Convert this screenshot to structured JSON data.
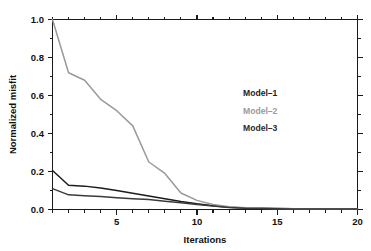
{
  "chart_data": {
    "type": "line",
    "title": "",
    "xlabel": "Iterations",
    "ylabel": "Normalized misfit",
    "xlim": [
      1,
      20
    ],
    "ylim": [
      0.0,
      1.0
    ],
    "grid": false,
    "legend_position": "upper-right-inside",
    "x": [
      1,
      2,
      3,
      4,
      5,
      6,
      7,
      8,
      9,
      10,
      11,
      12,
      13,
      14,
      15,
      16,
      17,
      18,
      19,
      20
    ],
    "xticks": [
      5,
      10,
      15,
      20
    ],
    "xticklabels": [
      "5",
      "10",
      "15",
      "20"
    ],
    "xminor_ticks": [
      1,
      2,
      3,
      4,
      5,
      6,
      7,
      8,
      9,
      10,
      11,
      12,
      13,
      14,
      15,
      16,
      17,
      18,
      19,
      20
    ],
    "yticks": [
      0.0,
      0.2,
      0.4,
      0.6,
      0.8,
      1.0
    ],
    "yticklabels": [
      "0.0",
      "0.2",
      "0.4",
      "0.6",
      "0.8",
      "1.0"
    ],
    "yminor_ticks": [
      0.1,
      0.3,
      0.5,
      0.7,
      0.9
    ],
    "series": [
      {
        "name": "Model-1",
        "color": "#1c1c1c",
        "linewidth": 1.5,
        "values": [
          0.205,
          0.128,
          0.123,
          0.113,
          0.1,
          0.086,
          0.071,
          0.056,
          0.042,
          0.03,
          0.02,
          0.012,
          0.008,
          0.006,
          0.005,
          0.004,
          0.003,
          0.003,
          0.002,
          0.002
        ]
      },
      {
        "name": "Model-2",
        "color": "#9a9a9a",
        "linewidth": 1.5,
        "values": [
          1.0,
          0.72,
          0.68,
          0.58,
          0.52,
          0.44,
          0.25,
          0.19,
          0.087,
          0.048,
          0.026,
          0.014,
          0.009,
          0.006,
          0.005,
          0.004,
          0.003,
          0.003,
          0.002,
          0.002
        ]
      },
      {
        "name": "Model-3",
        "color": "#3a3a3a",
        "linewidth": 1.5,
        "values": [
          0.11,
          0.077,
          0.073,
          0.068,
          0.062,
          0.057,
          0.052,
          0.044,
          0.035,
          0.026,
          0.018,
          0.011,
          0.007,
          0.005,
          0.004,
          0.003,
          0.003,
          0.002,
          0.002,
          0.002
        ]
      }
    ],
    "legend": [
      {
        "label": "Model–1",
        "color": "#1c1c1c"
      },
      {
        "label": "Model–2",
        "color": "#9a9a9a"
      },
      {
        "label": "Model–3",
        "color": "#2a2a2a"
      }
    ]
  }
}
